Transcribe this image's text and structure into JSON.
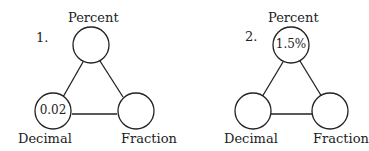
{
  "diagrams": [
    {
      "number": "1.",
      "top_label": "Percent",
      "left_label": "Decimal",
      "right_label": "Fraction",
      "top_value": "",
      "left_value": "0.02",
      "right_value": ""
    },
    {
      "number": "2.",
      "top_label": "Percent",
      "left_label": "Decimal",
      "right_label": "Fraction",
      "top_value": "1.5%",
      "left_value": "",
      "right_value": ""
    }
  ]
}
